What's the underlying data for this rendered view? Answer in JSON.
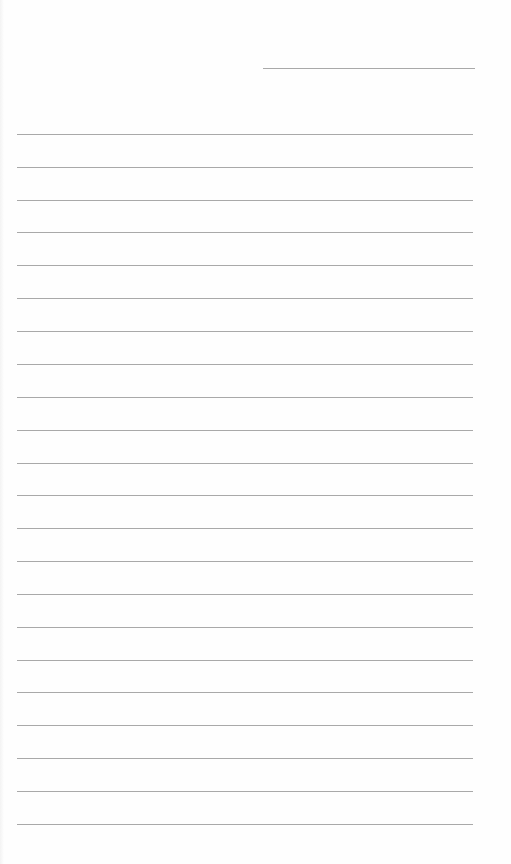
{
  "page": {
    "type": "lined-paper",
    "background_color": "#fefefe",
    "line_color": "#a9a9a9"
  },
  "header_line": {
    "x": 263,
    "y": 68,
    "width": 212
  },
  "writing_lines": {
    "count": 22,
    "x": 17,
    "width": 456,
    "y_positions": [
      134,
      167,
      200,
      232,
      265,
      298,
      331,
      364,
      397,
      430,
      463,
      495,
      528,
      561,
      594,
      627,
      660,
      692,
      725,
      758,
      791,
      824
    ]
  }
}
